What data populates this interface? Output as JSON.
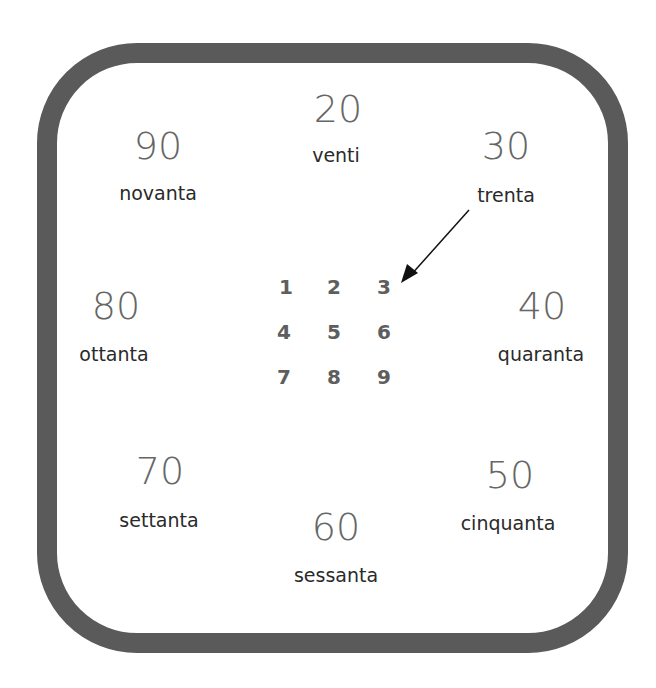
{
  "diagram": {
    "tens": [
      {
        "number": "20",
        "word": "venti"
      },
      {
        "number": "30",
        "word": "trenta"
      },
      {
        "number": "40",
        "word": "quaranta"
      },
      {
        "number": "50",
        "word": "cinquanta"
      },
      {
        "number": "60",
        "word": "sessanta"
      },
      {
        "number": "70",
        "word": "settanta"
      },
      {
        "number": "80",
        "word": "ottanta"
      },
      {
        "number": "90",
        "word": "novanta"
      }
    ],
    "digits": [
      "1",
      "2",
      "3",
      "4",
      "5",
      "6",
      "7",
      "8",
      "9"
    ],
    "arrow": {
      "from": "trenta",
      "to": "3"
    },
    "colors": {
      "frame": "#5a5a5a",
      "numbers": "#666666",
      "words": "#2a2a2a",
      "digits": "#5e5e5e"
    }
  }
}
